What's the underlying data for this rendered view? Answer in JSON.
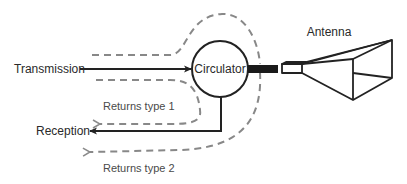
{
  "diagram": {
    "nodes": {
      "circulator": "Circulator",
      "antenna": "Antenna"
    },
    "labels": {
      "transmission": "Transmission",
      "reception": "Reception",
      "returns_type_1": "Returns type 1",
      "returns_type_2": "Returns type 2"
    },
    "edges": [
      {
        "from": "Transmission",
        "to": "Circulator",
        "style": "solid"
      },
      {
        "from": "Circulator",
        "to": "Antenna",
        "style": "thick-waveguide"
      },
      {
        "from": "Circulator",
        "to": "Reception",
        "style": "solid"
      },
      {
        "from": "Transmission",
        "to": "Reception",
        "style": "dashed",
        "label": "Returns type 1"
      },
      {
        "from": "Transmission",
        "to": "Reception",
        "style": "dashed",
        "label": "Returns type 2"
      }
    ],
    "colors": {
      "solid": "#222222",
      "dashed": "#808080"
    }
  }
}
